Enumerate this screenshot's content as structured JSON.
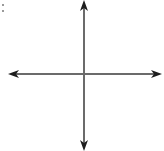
{
  "diagram": {
    "type": "coordinate-axes",
    "axes": [
      {
        "name": "x-axis",
        "orientation": "horizontal",
        "arrows": [
          "left",
          "right"
        ]
      },
      {
        "name": "y-axis",
        "orientation": "vertical",
        "arrows": [
          "up",
          "down"
        ]
      }
    ],
    "colors": {
      "axis_line": "#6b6b6b",
      "arrowhead": "#1e1e1e",
      "background": "#ffffff"
    }
  }
}
